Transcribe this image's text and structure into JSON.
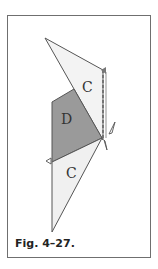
{
  "figure": {
    "caption": "Fig. 4–27.",
    "regions": [
      {
        "label": "C",
        "position": "upper",
        "fill": "#f2f2f2"
      },
      {
        "label": "D",
        "position": "middle",
        "fill": "#9a9a9a"
      },
      {
        "label": "C",
        "position": "lower",
        "fill": "#f0f0f0"
      }
    ],
    "colors": {
      "frame": "#6f6f6f",
      "outline": "#555555",
      "dark_fill": "#9a9a9a",
      "light_fill": "#f2f2f2"
    }
  }
}
